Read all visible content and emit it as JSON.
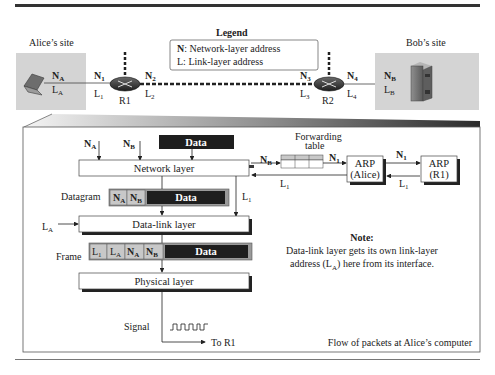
{
  "legend": {
    "title": "Legend",
    "n_item": {
      "key": "N",
      "desc": ": Network-layer address"
    },
    "l_item": {
      "key": "L",
      "desc": ": Link-layer address"
    }
  },
  "sites": {
    "alice": {
      "label": "Alice’s site",
      "net": "A",
      "link": "A"
    },
    "bob": {
      "label": "Bob’s site",
      "net": "B",
      "link": "B"
    }
  },
  "routers": [
    {
      "name": "R1",
      "left_n": "1",
      "left_l": "1",
      "right_n": "2",
      "right_l": "2"
    },
    {
      "name": "R2",
      "left_n": "3",
      "left_l": "3",
      "right_n": "4",
      "right_l": "4"
    }
  ],
  "detail": {
    "inputs": {
      "na": "A",
      "nb": "B",
      "data": "Data"
    },
    "layers": {
      "network": "Network layer",
      "datalink": "Data-link layer",
      "physical": "Physical layer"
    },
    "datagram": {
      "label": "Datagram",
      "fields": [
        "A",
        "B"
      ],
      "data": "Data"
    },
    "frame": {
      "label": "Frame",
      "fields": [
        "L1",
        "LA",
        "NA",
        "NB"
      ],
      "data": "Data"
    },
    "la_input": "A",
    "l1_down": "1",
    "forwarding": {
      "title_line1": "Forwarding",
      "title_line2": "table",
      "in_n": "B",
      "out_n": "1",
      "back_l": "1"
    },
    "arp_alice": {
      "line1": "ARP",
      "line2": "(Alice)"
    },
    "arp_r1": {
      "line1": "ARP",
      "line2": "(R1)",
      "query_n": "1",
      "reply_l": "1"
    },
    "note": {
      "title": "Note:",
      "line1": "Data-link layer gets its own link-layer",
      "line2_pre": "address (L",
      "line2_sub": "A",
      "line2_post": ") here from its interface."
    },
    "signal_label": "Signal",
    "to_label": "To R1",
    "caption": "Flow of packets at Alice’s computer"
  },
  "colors": {
    "site_bg": "#d4d4d4",
    "field_bg": "#c8c8c8",
    "data_bg": "#1e1e1e",
    "frame_strip": "#9a9a9a"
  }
}
